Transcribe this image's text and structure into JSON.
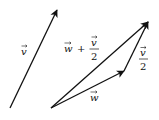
{
  "diagram": {
    "title": "",
    "vectors": [
      {
        "id": "v",
        "label": "v",
        "from": [
          10,
          108
        ],
        "to": [
          57,
          10
        ]
      },
      {
        "id": "w",
        "label": "w",
        "from": [
          51,
          108
        ],
        "to": [
          124,
          71
        ]
      },
      {
        "id": "v_half",
        "label": "v/2",
        "from": [
          124,
          71
        ],
        "to": [
          148,
          22
        ]
      },
      {
        "id": "w_plus_v_half",
        "label": "w + v/2",
        "from": [
          51,
          108
        ],
        "to": [
          148,
          22
        ]
      }
    ],
    "labels": {
      "v": "v",
      "w": "w",
      "v_half_num": "v",
      "v_half_den": "2",
      "sum_w": "w",
      "sum_plus": "+",
      "sum_num": "v",
      "sum_den": "2"
    },
    "colors": {
      "stroke": "#111111",
      "background": "#ffffff"
    }
  }
}
